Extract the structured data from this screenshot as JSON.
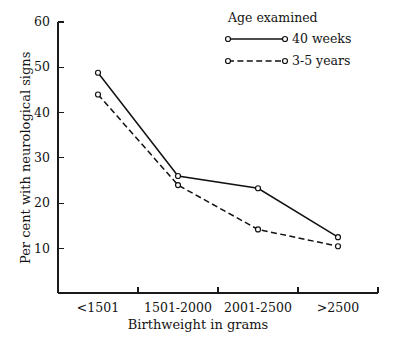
{
  "chart_data": {
    "type": "line",
    "title": "",
    "xlabel": "Birthweight in grams",
    "ylabel": "Per cent with neurological signs",
    "categories": [
      "<1501",
      "1501-2000",
      "2001-2500",
      ">2500"
    ],
    "ylim": [
      0,
      60
    ],
    "yticks": [
      10,
      20,
      30,
      40,
      50,
      60
    ],
    "ytick_labels": [
      "10",
      "20",
      "30",
      "40",
      "50",
      "60"
    ],
    "grid": false,
    "legend_position": "top-right",
    "legend_title": "Age examined",
    "series": [
      {
        "name": "40 weeks",
        "style": "solid",
        "marker": "open-circle",
        "values": [
          48.8,
          26.0,
          23.3,
          12.5
        ]
      },
      {
        "name": "3-5 years",
        "style": "dashed",
        "marker": "open-circle",
        "values": [
          44.0,
          24.0,
          14.2,
          10.5
        ]
      }
    ],
    "colors": {
      "axis": "#1a1a1a",
      "series_40_weeks": "#111111",
      "series_3_5_years": "#111111",
      "background": "#ffffff"
    }
  }
}
